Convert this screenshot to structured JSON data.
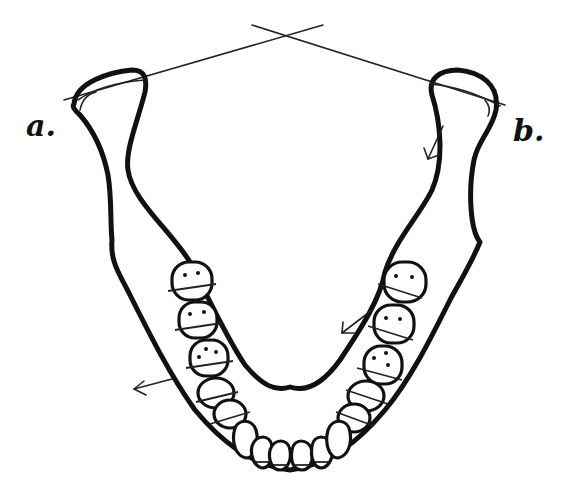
{
  "figure": {
    "labels": {
      "left": "a.",
      "right": "b."
    },
    "elements": {
      "condylar_axis_lines": "two lines through condyles crossing above midline",
      "arrows": [
        {
          "position": "right ramus inner",
          "direction": "down-left"
        },
        {
          "position": "right premolar region",
          "direction": "down-left"
        },
        {
          "position": "left body outer",
          "direction": "left"
        }
      ],
      "teeth_per_side_posterior": 5,
      "anterior_teeth": 6
    },
    "colors": {
      "line": "#111111",
      "background": "#ffffff"
    }
  }
}
